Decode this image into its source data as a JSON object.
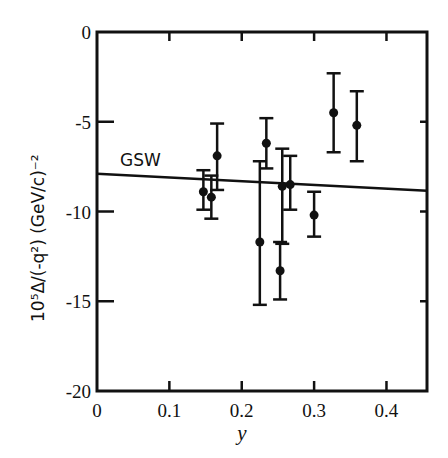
{
  "chart_data": {
    "type": "scatter",
    "title": "",
    "xlabel": "y",
    "ylabel": "10⁵Δ/(-q²)  (GeV/c)⁻²",
    "xlim": [
      0,
      0.456
    ],
    "ylim": [
      -20,
      0
    ],
    "x_ticks": [
      0,
      0.1,
      0.2,
      0.3,
      0.4
    ],
    "x_tick_labels": [
      "0",
      "0.1",
      "0.2",
      "0.3",
      "0.4"
    ],
    "y_ticks": [
      0,
      -5,
      -10,
      -15,
      -20
    ],
    "y_tick_labels": [
      "0",
      "-5",
      "-10",
      "-15",
      "-20"
    ],
    "grid": false,
    "legend": null,
    "series": [
      {
        "name": "data",
        "marker": "filled-circle",
        "points": [
          {
            "x": 0.147,
            "y": -8.9,
            "y_low": -9.9,
            "y_high": -7.7
          },
          {
            "x": 0.158,
            "y": -9.2,
            "y_low": -10.4,
            "y_high": -8.0
          },
          {
            "x": 0.166,
            "y": -6.9,
            "y_low": -8.8,
            "y_high": -5.1
          },
          {
            "x": 0.225,
            "y": -11.7,
            "y_low": -15.2,
            "y_high": -7.2
          },
          {
            "x": 0.234,
            "y": -6.2,
            "y_low": -7.6,
            "y_high": -4.8
          },
          {
            "x": 0.253,
            "y": -13.3,
            "y_low": -14.9,
            "y_high": -11.7
          },
          {
            "x": 0.256,
            "y": -8.6,
            "y_low": -11.8,
            "y_high": -6.5
          },
          {
            "x": 0.267,
            "y": -8.5,
            "y_low": -9.9,
            "y_high": -6.9
          },
          {
            "x": 0.3,
            "y": -10.2,
            "y_low": -11.4,
            "y_high": -8.9
          },
          {
            "x": 0.327,
            "y": -4.5,
            "y_low": -6.7,
            "y_high": -2.3
          },
          {
            "x": 0.359,
            "y": -5.2,
            "y_low": -7.2,
            "y_high": -3.3
          }
        ]
      },
      {
        "name": "GSW",
        "type": "line",
        "x": [
          0,
          0.456
        ],
        "y": [
          -7.9,
          -8.85
        ]
      }
    ],
    "annotations": [
      {
        "text": "GSW",
        "x": 0.033,
        "y": -7.2
      }
    ]
  },
  "labels": {
    "xlabel": "y",
    "gsw": "GSW"
  }
}
